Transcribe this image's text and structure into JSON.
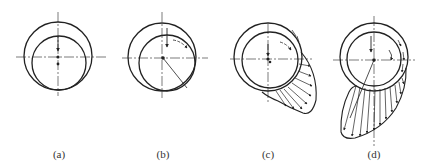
{
  "figure": {
    "panels": [
      {
        "id": "a",
        "label": "(a)",
        "state": "journal at rest, contact at bottom"
      },
      {
        "id": "b",
        "label": "(b)",
        "state": "journal begins rotating, climbs bearing wall"
      },
      {
        "id": "c",
        "label": "(c)",
        "state": "oil wedge forms, pressure distribution develops"
      },
      {
        "id": "d",
        "label": "(d)",
        "state": "full hydrodynamic lubrication, journal floats"
      }
    ]
  },
  "colors": {
    "line": "#222222",
    "background": "#ffffff"
  }
}
